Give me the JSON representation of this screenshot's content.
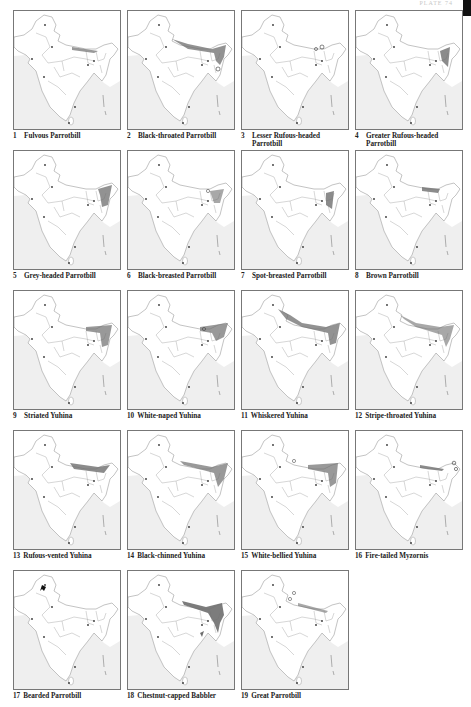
{
  "header": {
    "plate_label": "PLATE 74"
  },
  "chart_data": {
    "type": "table",
    "layout": {
      "columns": 4,
      "rows": 5
    },
    "maps": [
      {
        "num": "1",
        "name": "Fulvous Parrotbill",
        "range": "E Himalaya band (patchy)",
        "markers": "spots"
      },
      {
        "num": "2",
        "name": "Black-throated Parrotbill",
        "range": "Himalaya band + NE hills",
        "markers": "spots + circle"
      },
      {
        "num": "3",
        "name": "Lesser Rufous-headed Parrotbill",
        "range": "E Himalaya, scattered",
        "markers": "circles"
      },
      {
        "num": "4",
        "name": "Greater Rufous-headed Parrotbill",
        "range": "NE hills / E Himalaya",
        "markers": "circle"
      },
      {
        "num": "5",
        "name": "Grey-headed Parrotbill",
        "range": "NE India hills",
        "markers": "spots"
      },
      {
        "num": "6",
        "name": "Black-breasted Parrotbill",
        "range": "Assam / NE plains",
        "markers": "circles"
      },
      {
        "num": "7",
        "name": "Spot-breasted Parrotbill",
        "range": "NE hills south of Brahmaputra",
        "markers": "none"
      },
      {
        "num": "8",
        "name": "Brown Parrotbill",
        "range": "E Himalaya band",
        "markers": "none"
      },
      {
        "num": "9",
        "name": "Striated Yuhina",
        "range": "E Himalaya + NE hills",
        "markers": "none"
      },
      {
        "num": "10",
        "name": "White-naped Yuhina",
        "range": "E Himalaya + NE hills",
        "markers": "circles"
      },
      {
        "num": "11",
        "name": "Whiskered Yuhina",
        "range": "Whole Himalaya + NE",
        "markers": "none"
      },
      {
        "num": "12",
        "name": "Stripe-throated Yuhina",
        "range": "Himalaya band + NE",
        "markers": "spots"
      },
      {
        "num": "13",
        "name": "Rufous-vented Yuhina",
        "range": "C–E Himalaya",
        "markers": "none"
      },
      {
        "num": "14",
        "name": "Black-chinned Yuhina",
        "range": "Himalaya + NE hills",
        "markers": "spots"
      },
      {
        "num": "15",
        "name": "White-bellied Yuhina",
        "range": "E Himalaya + NE hills",
        "markers": "circles"
      },
      {
        "num": "16",
        "name": "Fire-tailed Myzornis",
        "range": "E Himalaya band",
        "markers": "circles"
      },
      {
        "num": "17",
        "name": "Bearded Parrotbill",
        "range": "NW single locality",
        "markers": "arrow"
      },
      {
        "num": "18",
        "name": "Chestnut-capped Babbler",
        "range": "Terai, Assam, Bangladesh, Orissa coast",
        "markers": "none"
      },
      {
        "num": "19",
        "name": "Great Parrotbill",
        "range": "C–E Himalaya",
        "markers": "circles"
      }
    ]
  },
  "colors": {
    "range_fill": "#6e6e6e",
    "sea": "#efefef",
    "outline": "#9a9a9a",
    "frame": "#777777"
  }
}
